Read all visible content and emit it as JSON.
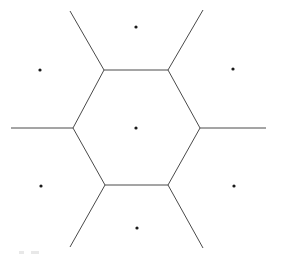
{
  "figure": {
    "width": 281,
    "height": 260,
    "background_color": "#ffffff",
    "edge_color": "#4a4a4a",
    "point_color": "#1a1a1a",
    "edge_width": 1,
    "point_radius": 1.6
  },
  "chart_data": {
    "type": "scatter",
    "title": "",
    "subtitle": "",
    "xlabel": "",
    "ylabel": "",
    "xlim": [
      0,
      281
    ],
    "ylim": [
      0,
      260
    ],
    "grid": false,
    "legend": null,
    "series": [
      {
        "name": "seed points",
        "marker": "dot",
        "points": [
          {
            "label": "center",
            "x": 136,
            "y": 128
          },
          {
            "label": "top",
            "x": 136,
            "y": 27
          },
          {
            "label": "upper-left",
            "x": 40,
            "y": 70
          },
          {
            "label": "upper-right",
            "x": 233,
            "y": 69
          },
          {
            "label": "lower-left",
            "x": 41,
            "y": 186
          },
          {
            "label": "lower-right",
            "x": 234,
            "y": 186
          },
          {
            "label": "bottom",
            "x": 137,
            "y": 228
          }
        ]
      }
    ],
    "hexagon_vertices": [
      {
        "label": "top-left",
        "x": 104,
        "y": 70
      },
      {
        "label": "top-right",
        "x": 168,
        "y": 70
      },
      {
        "label": "right",
        "x": 200,
        "y": 128
      },
      {
        "label": "bottom-right",
        "x": 168,
        "y": 185
      },
      {
        "label": "bottom-left",
        "x": 105,
        "y": 185
      },
      {
        "label": "left",
        "x": 73,
        "y": 128
      }
    ],
    "hexagon_edges": [
      {
        "name": "edge-top",
        "x1": 104,
        "y1": 70,
        "x2": 168,
        "y2": 70
      },
      {
        "name": "edge-upper-right",
        "x1": 168,
        "y1": 70,
        "x2": 200,
        "y2": 128
      },
      {
        "name": "edge-lower-right",
        "x1": 200,
        "y1": 128,
        "x2": 168,
        "y2": 185
      },
      {
        "name": "edge-bottom",
        "x1": 168,
        "y1": 185,
        "x2": 105,
        "y2": 185
      },
      {
        "name": "edge-lower-left",
        "x1": 105,
        "y1": 185,
        "x2": 73,
        "y2": 128
      },
      {
        "name": "edge-upper-left",
        "x1": 73,
        "y1": 128,
        "x2": 104,
        "y2": 70
      }
    ],
    "unbounded_rays": [
      {
        "name": "ray-upper-left",
        "x1": 104,
        "y1": 70,
        "x2": 70,
        "y2": 11
      },
      {
        "name": "ray-upper-right",
        "x1": 168,
        "y1": 70,
        "x2": 203,
        "y2": 10
      },
      {
        "name": "ray-right",
        "x1": 200,
        "y1": 128,
        "x2": 266,
        "y2": 128
      },
      {
        "name": "ray-lower-right",
        "x1": 168,
        "y1": 185,
        "x2": 203,
        "y2": 248
      },
      {
        "name": "ray-lower-left",
        "x1": 105,
        "y1": 185,
        "x2": 70,
        "y2": 247
      },
      {
        "name": "ray-left",
        "x1": 73,
        "y1": 128,
        "x2": 11,
        "y2": 128
      }
    ],
    "artifacts": [
      {
        "name": "corner-mark-1",
        "x": 19,
        "y": 251,
        "w": 5,
        "h": 3
      },
      {
        "name": "corner-mark-2",
        "x": 31,
        "y": 251,
        "w": 8,
        "h": 3
      }
    ]
  }
}
